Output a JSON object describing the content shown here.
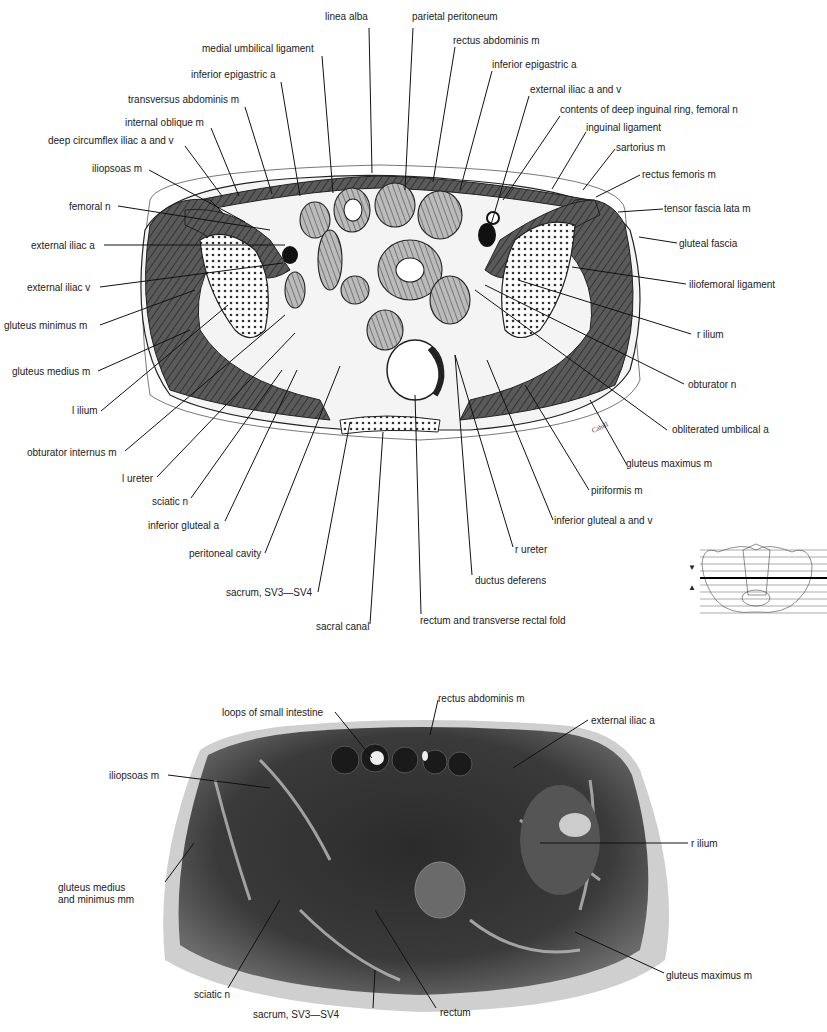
{
  "top_figure": {
    "type": "drawing",
    "signature": "Cahill",
    "labels": [
      {
        "id": "linea-alba",
        "text": "linea alba",
        "x": 325,
        "y": 11
      },
      {
        "id": "parietal-peritoneum",
        "text": "parietal peritoneum",
        "x": 412,
        "y": 11
      },
      {
        "id": "medial-umbilical-ligament",
        "text": "medial umbilical ligament",
        "x": 202,
        "y": 43
      },
      {
        "id": "rectus-abdominis",
        "text": "rectus abdominis m",
        "x": 453,
        "y": 35
      },
      {
        "id": "inferior-epigastric-a-left",
        "text": "inferior epigastric a",
        "x": 191,
        "y": 69
      },
      {
        "id": "inferior-epigastric-a-right",
        "text": "inferior epigastric a",
        "x": 492,
        "y": 59
      },
      {
        "id": "transversus-abdominis",
        "text": "transversus abdominis m",
        "x": 128,
        "y": 94
      },
      {
        "id": "external-iliac-a-and-v",
        "text": "external iliac a and v",
        "x": 530,
        "y": 84
      },
      {
        "id": "internal-oblique",
        "text": "internal oblique m",
        "x": 125,
        "y": 117
      },
      {
        "id": "contents-deep-inguinal-ring",
        "text": "contents of deep inguinal ring, femoral n",
        "x": 560,
        "y": 104
      },
      {
        "id": "deep-circumflex-iliac",
        "text": "deep circumflex iliac a and v",
        "x": 48,
        "y": 135
      },
      {
        "id": "inguinal-ligament",
        "text": "inguinal ligament",
        "x": 586,
        "y": 122
      },
      {
        "id": "sartorius",
        "text": "sartorius m",
        "x": 616,
        "y": 142
      },
      {
        "id": "iliopsoas",
        "text": "iliopsoas m",
        "x": 92,
        "y": 163
      },
      {
        "id": "rectus-femoris",
        "text": "rectus femoris m",
        "x": 642,
        "y": 169
      },
      {
        "id": "femoral-n",
        "text": "femoral n",
        "x": 69,
        "y": 201
      },
      {
        "id": "tensor-fascia-lata",
        "text": "tensor fascia lata m",
        "x": 664,
        "y": 203
      },
      {
        "id": "external-iliac-a",
        "text": "external iliac a",
        "x": 31,
        "y": 240
      },
      {
        "id": "gluteal-fascia",
        "text": "gluteal fascia",
        "x": 679,
        "y": 238
      },
      {
        "id": "iliofemoral-ligament",
        "text": "iliofemoral ligament",
        "x": 689,
        "y": 279
      },
      {
        "id": "external-iliac-v",
        "text": "external iliac v",
        "x": 27,
        "y": 282
      },
      {
        "id": "gluteus-minimus",
        "text": "gluteus minimus m",
        "x": 4,
        "y": 320
      },
      {
        "id": "r-ilium",
        "text": "r ilium",
        "x": 697,
        "y": 329
      },
      {
        "id": "gluteus-medius",
        "text": "gluteus medius m",
        "x": 12,
        "y": 366
      },
      {
        "id": "obturator-n",
        "text": "obturator n",
        "x": 688,
        "y": 379
      },
      {
        "id": "l-ilium",
        "text": "l ilium",
        "x": 72,
        "y": 405
      },
      {
        "id": "obliterated-umbilical-a",
        "text": "obliterated umbilical a",
        "x": 672,
        "y": 424
      },
      {
        "id": "obturator-internus",
        "text": "obturator internus m",
        "x": 27,
        "y": 447
      },
      {
        "id": "gluteus-maximus",
        "text": "gluteus maximus m",
        "x": 626,
        "y": 458
      },
      {
        "id": "l-ureter",
        "text": "l ureter",
        "x": 122,
        "y": 473
      },
      {
        "id": "piriformis",
        "text": "piriformis m",
        "x": 591,
        "y": 485
      },
      {
        "id": "sciatic-n",
        "text": "sciatic n",
        "x": 152,
        "y": 496
      },
      {
        "id": "inferior-gluteal-a-and-v",
        "text": "inferior gluteal a and v",
        "x": 554,
        "y": 515
      },
      {
        "id": "inferior-gluteal-a",
        "text": "inferior gluteal a",
        "x": 148,
        "y": 520
      },
      {
        "id": "peritoneal-cavity",
        "text": "peritoneal cavity",
        "x": 189,
        "y": 548
      },
      {
        "id": "r-ureter",
        "text": "r ureter",
        "x": 515,
        "y": 544
      },
      {
        "id": "ductus-deferens",
        "text": "ductus deferens",
        "x": 475,
        "y": 575
      },
      {
        "id": "sacrum-top",
        "text": "sacrum, SV3—SV4",
        "x": 226,
        "y": 587
      },
      {
        "id": "sacral-canal",
        "text": "sacral canal",
        "x": 316,
        "y": 621
      },
      {
        "id": "rectum-transverse-fold",
        "text": "rectum and transverse rectal fold",
        "x": 420,
        "y": 615
      }
    ]
  },
  "locator_thumbnail": {
    "description": "pelvis outline with horizontal section lines; bold line marks current level",
    "arrow_up": "▲",
    "arrow_down": "▼"
  },
  "bottom_figure": {
    "type": "photograph",
    "labels": [
      {
        "id": "loops-small-intestine",
        "text": "loops of small intestine",
        "x": 222,
        "y": 707
      },
      {
        "id": "rectus-abdominis-photo",
        "text": "rectus abdominis m",
        "x": 438,
        "y": 693
      },
      {
        "id": "external-iliac-a-photo",
        "text": "external iliac a",
        "x": 591,
        "y": 715
      },
      {
        "id": "iliopsoas-photo",
        "text": "iliopsoas m",
        "x": 109,
        "y": 770
      },
      {
        "id": "r-ilium-photo",
        "text": "r ilium",
        "x": 691,
        "y": 838
      },
      {
        "id": "gluteus-medius-minimus",
        "text": "gluteus medius\nand minimus mm",
        "x": 58,
        "y": 882
      },
      {
        "id": "gluteus-maximus-photo",
        "text": "gluteus maximus m",
        "x": 666,
        "y": 970
      },
      {
        "id": "sciatic-n-photo",
        "text": "sciatic n",
        "x": 194,
        "y": 989
      },
      {
        "id": "sacrum-photo",
        "text": "sacrum, SV3—SV4",
        "x": 253,
        "y": 1009
      },
      {
        "id": "rectum-photo",
        "text": "rectum",
        "x": 440,
        "y": 1007
      }
    ]
  }
}
